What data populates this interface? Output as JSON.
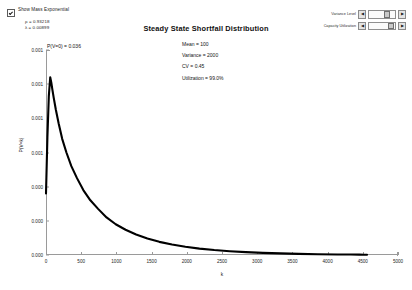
{
  "controls": {
    "checkbox": {
      "label": "Show Mass Exponential",
      "checked": true
    },
    "params": [
      "ρ = 0.93218",
      "λ = 0.00899"
    ],
    "sliders": [
      {
        "label": "Variance Level",
        "dec": "◀",
        "inc": "▶"
      },
      {
        "label": "Capacity Utilization",
        "dec": "◀",
        "inc": "▶"
      }
    ]
  },
  "chart_data": {
    "type": "line",
    "title": "Steady State Shortfall Distribution",
    "xlabel": "k",
    "ylabel": "P(V=k)",
    "xlim": [
      0,
      5000
    ],
    "ylim": [
      0,
      0.0012
    ],
    "grid": false,
    "legend": null,
    "xticks": [
      0,
      500,
      1000,
      1500,
      2000,
      2500,
      3000,
      3500,
      4000,
      4500,
      5000
    ],
    "xticklabels": [
      "0",
      "500",
      "1000",
      "1500",
      "2000",
      "2500",
      "3000",
      "3500",
      "4000",
      "4500",
      "5000"
    ],
    "yticks": [
      0.0,
      0.0002,
      0.0004,
      0.0006,
      0.0008,
      0.001,
      0.0012
    ],
    "yticklabels": [
      "0.000",
      "0.000",
      "0.000",
      "0.001",
      "0.001",
      "0.001",
      "0.001"
    ],
    "annotations": [
      "P(V=0) = 0.036"
    ],
    "stats": [
      "Mean = 100",
      "Variance = 2000",
      "CV = 0.45",
      "Utilization = 99.0%"
    ],
    "series": [
      {
        "name": "Shortfall density",
        "color": "#000000",
        "x": [
          0,
          20,
          40,
          60,
          75,
          90,
          110,
          140,
          180,
          230,
          290,
          360,
          440,
          530,
          630,
          740,
          860,
          990,
          1130,
          1280,
          1440,
          1610,
          1790,
          1980,
          2180,
          2390,
          2610,
          2840,
          3080,
          3330,
          3590,
          3860,
          4140,
          4330,
          4450,
          4520,
          4560
        ],
        "y": [
          0.00036,
          0.00069,
          0.00093,
          0.00104,
          0.00101,
          0.00097,
          0.00092,
          0.00085,
          0.00077,
          0.00068,
          0.0006,
          0.00052,
          0.00045,
          0.00038,
          0.00032,
          0.00027,
          0.00022,
          0.00018,
          0.000148,
          0.00012,
          9.65e-05,
          7.7e-05,
          6.1e-05,
          4.8e-05,
          3.75e-05,
          2.9e-05,
          2.22e-05,
          1.68e-05,
          1.26e-05,
          9.3e-06,
          6.8e-06,
          4.8e-06,
          3.3e-06,
          2.5e-06,
          2e-06,
          1.7e-06,
          1.5e-06
        ]
      }
    ]
  }
}
